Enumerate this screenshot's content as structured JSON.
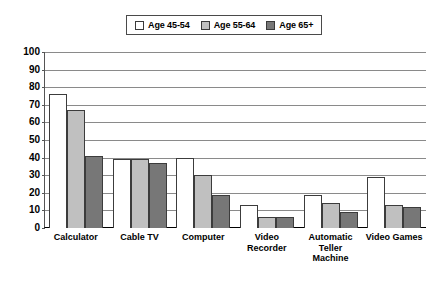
{
  "legend": {
    "entries": [
      {
        "label": "Age 45-54",
        "color": "#ffffff"
      },
      {
        "label": "Age 55-64",
        "color": "#c0c0c0"
      },
      {
        "label": "Age 65+",
        "color": "#777777"
      }
    ]
  },
  "axis": {
    "y_ticks": [
      "100",
      "90",
      "80",
      "70",
      "60",
      "50",
      "40",
      "30",
      "20",
      "10",
      "0"
    ]
  },
  "caption": "",
  "chart_data": {
    "type": "bar",
    "title": "",
    "xlabel": "",
    "ylabel": "",
    "ylim": [
      0,
      100
    ],
    "ytick_step": 10,
    "grid": true,
    "legend_position": "top-center",
    "categories": [
      "Calculator",
      "Cable TV",
      "Computer",
      "Video Recorder",
      "Automatic Teller Machine",
      "Video Games"
    ],
    "series": [
      {
        "name": "Age 45-54",
        "color": "#ffffff",
        "values": [
          76,
          39,
          40,
          13,
          19,
          29
        ]
      },
      {
        "name": "Age 55-64",
        "color": "#c0c0c0",
        "values": [
          67,
          39,
          30,
          6,
          14,
          13
        ]
      },
      {
        "name": "Age 65+",
        "color": "#777777",
        "values": [
          41,
          37,
          19,
          6,
          9,
          12
        ]
      }
    ]
  }
}
